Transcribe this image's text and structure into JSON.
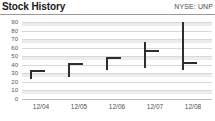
{
  "header": {
    "title": "Stock History",
    "ticker": "NYSE: UNP"
  },
  "chart_data": {
    "type": "bar",
    "title": "Stock History",
    "subtitle": "NYSE: UNP",
    "xlabel": "",
    "ylabel": "",
    "grid": true,
    "legend": "none",
    "ylim": [
      0,
      90
    ],
    "yticks": [
      90,
      80,
      70,
      60,
      50,
      40,
      30,
      20,
      10,
      0
    ],
    "ytick_labels": [
      "90",
      "80",
      "70",
      "60",
      "50",
      "40",
      "30",
      "20",
      "10",
      "0"
    ],
    "categories": [
      "12/04",
      "12/05",
      "12/06",
      "12/07",
      "12/08"
    ],
    "series": [
      {
        "name": "High",
        "values": [
          34,
          42,
          49,
          67,
          90
        ]
      },
      {
        "name": "Low",
        "values": [
          23,
          26,
          34,
          36,
          34
        ]
      },
      {
        "name": "Close",
        "values": [
          34,
          42,
          49,
          57,
          43
        ]
      }
    ]
  }
}
